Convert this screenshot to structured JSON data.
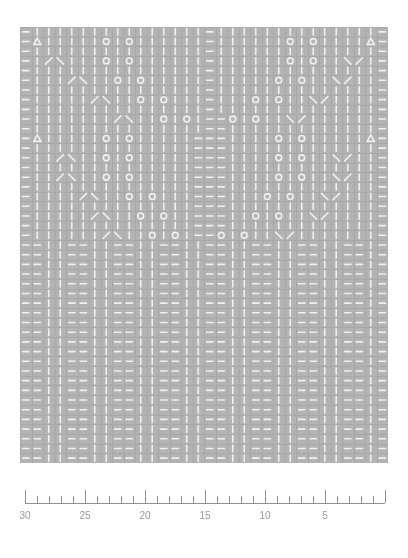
{
  "document": {
    "title": "Stitch Chart with Ruler",
    "background_color": "#ffffff"
  },
  "chart_data": {
    "type": "heatmap",
    "title": "",
    "xlabel": "",
    "ylabel": "",
    "grid": true,
    "legend": "none",
    "colors": {
      "cell_background": "#b3b3b3",
      "symbol": "#f0f0f0",
      "gridline": "#a8a8a8",
      "ruler_line": "#8f8f8f",
      "ruler_text": "#9a9a9a"
    },
    "geometry": {
      "origin_x": 20,
      "origin_y": 27,
      "width": 368,
      "height": 436,
      "columns": 32,
      "rows": 45,
      "cell_width": 11.5,
      "cell_height": 9.69
    },
    "symbol_legend": [
      {
        "key": "k",
        "name": "knit",
        "glyph": "vertical-bar"
      },
      {
        "key": "p",
        "name": "purl",
        "glyph": "horizontal-dash"
      },
      {
        "key": "o",
        "name": "yarn-over",
        "glyph": "circle"
      },
      {
        "key": "t",
        "name": "centred-decrease",
        "glyph": "triangle"
      },
      {
        "key": "l",
        "name": "left-leaning-decrease",
        "glyph": "slash"
      },
      {
        "key": "r",
        "name": "right-leaning-decrease",
        "glyph": "backslash"
      }
    ],
    "rows_top_to_bottom": [
      "pkkkkkkkkkkkkkkkpkkkkkkkkkkkkkkp",
      "ptkkkkkokokkkkkkpkkkkkkokokkkktp",
      "pkkkkkkkkkkkkkkkpkkkkkkkkkkkkkkp",
      "pklrkkkokokkkkkkpkkkkkkokokkrlkp",
      "pkkkkkkkkkkkkkkkpkkkkkkkkkkkkkkp",
      "pkkklrkkokokkkkkpkkkkkokokkrlkkp",
      "pkkkkkkkkkkkkkkkpkkkkkkkkkkkkkkp",
      "pkkkkklrkkokokkkpkkkokokkrlkkkkp",
      "pkkkkkkkkkkkkkkkpkkkkkkkkkkkkkkp",
      "pkkkkkkklrkkokokppokokkrlkkkkkkp",
      "pkkkkkkkkkkkkkkkppkkkkkkkkkkkkkp",
      "ptkkkkkokokkkkkpppkkkkokokkkkktp",
      "pkkkkkkkkkkkkkkpppkkkkkkkkkkkkkp",
      "pkklrkkokokkkkkpppkkkkokokkrlkkp",
      "pkkkkkkkkkkkkkkpppkkkkkkkkkkkkkp",
      "pkklrkkokokkkkkpppkkkkokokkrlkkp",
      "pkkkkkkkkkkkkkkpppkkkkkkkkkkkkkp",
      "pkkkklrkkokokkkpppkkkokokkrlkkkp",
      "pkkkkkkkkkkkkkkpppkkkkkkkkkkkkkp",
      "pkkkkklrkkokokkpppkkokokkrlkkkkp",
      "pkkkkkkkkkkkkkkpppkkkkkkkkkkkkkp",
      "pkkkkkklrkkokokppokokkrlkkkkkkkp",
      "ppkkppkkppkkppkkppkkppkkppkkppkp",
      "ppkkppkkppkkppkkppkkppkkppkkppkp",
      "ppkkppkkppkkppkkppkkppkkppkkppkp",
      "ppkkppkkppkkppkkppkkppkkppkkppkp",
      "ppkkppkkppkkppkkppkkppkkppkkppkp",
      "ppkkppkkppkkppkkppkkppkkppkkppkp",
      "ppkkppkkppkkppkkppkkppkkppkkppkp",
      "ppkkppkkppkkppkkppkkppkkppkkppkp",
      "ppkkppkkppkkppkkppkkppkkppkkppkp",
      "ppkkppkkppkkppkkppkkppkkppkkppkp",
      "ppkkppkkppkkppkkppkkppkkppkkppkp",
      "ppkkppkkppkkppkkppkkppkkppkkppkp",
      "ppkkppkkppkkppkkppkkppkkppkkppkp",
      "ppkkppkkppkkppkkppkkppkkppkkppkp",
      "ppkkppkkppkkppkkppkkppkkppkkppkp",
      "ppkkppkkppkkppkkppkkppkkppkkppkp",
      "ppkkppkkppkkppkkppkkppkkppkkppkp",
      "ppkkppkkppkkppkkppkkppkkppkkppkp",
      "ppkkppkkppkkppkkppkkppkkppkkppkp",
      "ppkkppkkppkkppkkppkkppkkppkkppkp",
      "ppkkppkkppkkppkkppkkppkkppkkppkp",
      "ppkkppkkppkkppkkppkkppkkppkkppkp",
      "ppkkppkkppkkppkkppkkppkkppkkppkp"
    ]
  },
  "ruler": {
    "name": "measurement-ruler",
    "direction": "right-to-left",
    "start_x": 25,
    "end_x": 385,
    "baseline_y": 33,
    "major_interval": 5,
    "minor_interval": 1,
    "max_value": 30,
    "min_value": 0,
    "labels": [
      {
        "value": 30,
        "text": "30"
      },
      {
        "value": 25,
        "text": "25"
      },
      {
        "value": 20,
        "text": "20"
      },
      {
        "value": 15,
        "text": "15"
      },
      {
        "value": 10,
        "text": "10"
      },
      {
        "value": 5,
        "text": "5"
      }
    ]
  }
}
